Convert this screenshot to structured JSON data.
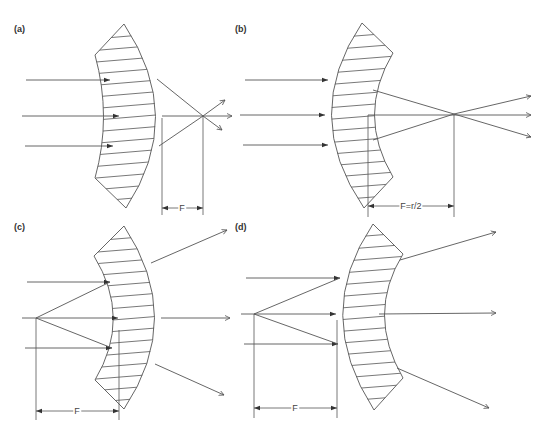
{
  "figure": {
    "stroke_color": "#555555",
    "background": "#ffffff",
    "panels": [
      {
        "id": "a",
        "label": "(a)",
        "label_pos": [
          18,
          30
        ],
        "lens": {
          "outline": "M124,24 L95,55 Q112,117 95,178 L126,208 Q186,117 124,24 Z",
          "hatch_x": [
            96,
            168
          ],
          "hatch_y0": 30,
          "hatch_y1": 204,
          "hatch_count": 15
        },
        "rays": [
          {
            "d": "M26,80 L110,80",
            "arrow_mid": true
          },
          {
            "d": "M22,116 L119,116",
            "arrow_mid": true
          },
          {
            "d": "M25,146 L113,146",
            "arrow_mid": true
          },
          {
            "d": "M157,79 L203,116 L222,130",
            "arrow_end": true
          },
          {
            "d": "M162,116 L232,116",
            "arrow_end": true
          },
          {
            "d": "M159,146 L203,116 L225,100",
            "arrow_end": true
          }
        ],
        "dim_lines": [
          {
            "d": "M162,118 L162,215"
          },
          {
            "d": "M203,116 L203,215"
          }
        ],
        "dimension": {
          "x1": 162,
          "x2": 203,
          "y": 208,
          "text": "F"
        }
      },
      {
        "id": "b",
        "label": "(b)",
        "label_pos": [
          239,
          30
        ],
        "lens": {
          "outline": "M362,23 L393,53 Q356,115 393,177 L364,208 Q300,115 362,23 Z",
          "hatch_x": [
            320,
            396
          ],
          "hatch_y0": 30,
          "hatch_y1": 204,
          "hatch_count": 15
        },
        "rays": [
          {
            "d": "M245,80 L328,80",
            "arrow_mid": true
          },
          {
            "d": "M240,115 L325,115",
            "arrow_mid": true
          },
          {
            "d": "M243,145 L328,145",
            "arrow_mid": true
          },
          {
            "d": "M373,90 L454,114 L531,137",
            "arrow_end": true
          },
          {
            "d": "M368,115 L531,115",
            "arrow_end": true
          },
          {
            "d": "M373,140 L454,114 L531,96",
            "arrow_end": true
          }
        ],
        "dim_lines": [
          {
            "d": "M368,115 L368,217"
          },
          {
            "d": "M454,114 L454,217"
          }
        ],
        "dimension": {
          "x1": 368,
          "x2": 454,
          "y": 206,
          "text": "F=r/2"
        }
      },
      {
        "id": "c",
        "label": "(c)",
        "label_pos": [
          18,
          228
        ],
        "lens": {
          "outline": "M124,226 L94,256 Q132,318 95,380 L124,409 Q185,318 124,226 Z",
          "hatch_x": [
            94,
            168
          ],
          "hatch_y0": 232,
          "hatch_y1": 405,
          "hatch_count": 15
        },
        "rays": [
          {
            "d": "M27,282 L110,282",
            "arrow_mid": true
          },
          {
            "d": "M22,318 L118,318",
            "arrow_mid": true
          },
          {
            "d": "M25,348 L112,348",
            "arrow_mid": true
          },
          {
            "d": "M36,318 L110,282",
            "arrow_none": true
          },
          {
            "d": "M36,318 L112,348",
            "arrow_none": true
          },
          {
            "d": "M151,263 L227,230",
            "arrow_end": true
          },
          {
            "d": "M161,318 L230,318",
            "arrow_end": true
          },
          {
            "d": "M155,364 L224,395",
            "arrow_end": true
          }
        ],
        "dim_lines": [
          {
            "d": "M36,318 L36,420"
          },
          {
            "d": "M119,330 L119,420"
          }
        ],
        "dimension": {
          "x1": 36,
          "x2": 119,
          "y": 411,
          "text": "F"
        }
      },
      {
        "id": "d",
        "label": "(d)",
        "label_pos": [
          239,
          228
        ],
        "lens": {
          "outline": "M373,224 L403,254 Q366,314 403,378 L374,410 Q312,314 373,224 Z",
          "hatch_x": [
            330,
            406
          ],
          "hatch_y0": 230,
          "hatch_y1": 405,
          "hatch_count": 15
        },
        "rays": [
          {
            "d": "M246,278 L340,278",
            "arrow_mid": true
          },
          {
            "d": "M241,314 L336,314",
            "arrow_mid": true
          },
          {
            "d": "M244,344 L338,344",
            "arrow_mid": true
          },
          {
            "d": "M254,314 L340,278",
            "arrow_none": true
          },
          {
            "d": "M254,314 L338,344",
            "arrow_none": true
          },
          {
            "d": "M400,260 L496,232",
            "arrow_end": true
          },
          {
            "d": "M379,314 L496,313",
            "arrow_end": true
          },
          {
            "d": "M397,368 L489,408",
            "arrow_end": true
          }
        ],
        "dim_lines": [
          {
            "d": "M254,314 L254,418"
          },
          {
            "d": "M337,320 L337,418"
          }
        ],
        "dimension": {
          "x1": 254,
          "x2": 337,
          "y": 408,
          "text": "F"
        }
      }
    ]
  }
}
